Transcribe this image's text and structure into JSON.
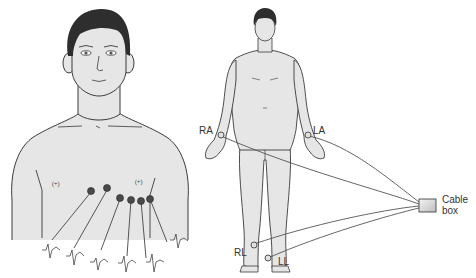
{
  "figure": {
    "left_panel": {
      "description": "Chest with precordial electrodes V1-V6 and ECG waveforms",
      "electrodes": [
        "V1",
        "V2",
        "V3",
        "V4",
        "V5",
        "V6"
      ],
      "rib_marks": [
        "(+)",
        "(+)"
      ]
    },
    "right_panel": {
      "description": "Full body with limb lead electrodes",
      "labels": {
        "ra": "RA",
        "la": "LA",
        "rl": "RL",
        "ll": "LL"
      },
      "cable_box": {
        "line1": "Cable",
        "line2": "box"
      }
    },
    "colors": {
      "skin": "#e6e6e6",
      "outline": "#3a3a3a",
      "hair": "#2e2e2e",
      "electrode": "#4a4a4a",
      "wire": "#555555",
      "box_fill": "#d8d8d8"
    }
  }
}
